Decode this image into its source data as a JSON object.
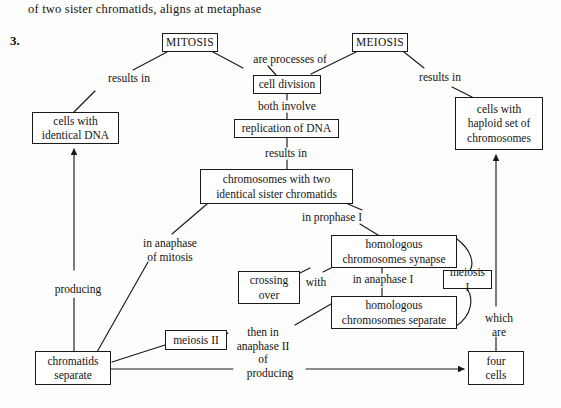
{
  "header": {
    "sentence": "of two sister chromatids, aligns at metaphase",
    "item_number": "3."
  },
  "diagram": {
    "type": "concept-map",
    "nodes": [
      {
        "id": "mitosis",
        "label": "MITOSIS",
        "x": 162,
        "y": 33,
        "w": 56,
        "h": 19
      },
      {
        "id": "meiosis",
        "label": "MEIOSIS",
        "x": 352,
        "y": 33,
        "w": 56,
        "h": 19
      },
      {
        "id": "cell-division",
        "label": "cell division",
        "x": 253,
        "y": 75,
        "w": 68,
        "h": 19
      },
      {
        "id": "replication",
        "label": "replication of DNA",
        "x": 234,
        "y": 119,
        "w": 105,
        "h": 19
      },
      {
        "id": "cells-identical",
        "label": "cells with\nidentical DNA",
        "x": 32,
        "y": 112,
        "w": 87,
        "h": 32
      },
      {
        "id": "cells-haploid",
        "label": "cells with\nhaploid set of\nchromosomes",
        "x": 455,
        "y": 97,
        "w": 88,
        "h": 53
      },
      {
        "id": "chromosomes-two",
        "label": "chromosomes with two\nidentical sister chromatids",
        "x": 200,
        "y": 169,
        "w": 153,
        "h": 35
      },
      {
        "id": "synapse",
        "label": "homologous\nchromosomes synapse",
        "x": 331,
        "y": 235,
        "w": 126,
        "h": 33
      },
      {
        "id": "crossing-over",
        "label": "crossing\nover",
        "x": 238,
        "y": 271,
        "w": 62,
        "h": 33
      },
      {
        "id": "meiosis-i",
        "label": "meiosis I",
        "x": 443,
        "y": 270,
        "w": 49,
        "h": 19
      },
      {
        "id": "separate",
        "label": "homologous\nchromosomes separate",
        "x": 331,
        "y": 296,
        "w": 126,
        "h": 33
      },
      {
        "id": "meiosis-ii",
        "label": "meiosis II",
        "x": 165,
        "y": 330,
        "w": 62,
        "h": 20
      },
      {
        "id": "chromatids-sep",
        "label": "chromatids\nseparate",
        "x": 35,
        "y": 351,
        "w": 76,
        "h": 34
      },
      {
        "id": "four-cells",
        "label": "four\ncells",
        "x": 468,
        "y": 351,
        "w": 56,
        "h": 34
      }
    ],
    "edge_labels": [
      {
        "id": "results-in-1",
        "text": "results in",
        "x": 97,
        "y": 72,
        "w": 64
      },
      {
        "id": "are-processes",
        "text": "are processes of",
        "x": 242,
        "y": 53,
        "w": 96
      },
      {
        "id": "results-in-2",
        "text": "results in",
        "x": 408,
        "y": 71,
        "w": 64
      },
      {
        "id": "both-involve",
        "text": "both involve",
        "x": 249,
        "y": 100,
        "w": 76
      },
      {
        "id": "results-in-3",
        "text": "results in",
        "x": 254,
        "y": 147,
        "w": 64
      },
      {
        "id": "in-anaphase-mit",
        "text": "in anaphase\nof mitosis",
        "x": 130,
        "y": 237,
        "w": 80
      },
      {
        "id": "in-prophase-i",
        "text": "in prophase I",
        "x": 292,
        "y": 211,
        "w": 80
      },
      {
        "id": "with",
        "text": "with",
        "x": 300,
        "y": 276,
        "w": 32
      },
      {
        "id": "in-anaphase-i",
        "text": "in anaphase I",
        "x": 340,
        "y": 273,
        "w": 86
      },
      {
        "id": "producing-left",
        "text": "producing",
        "x": 45,
        "y": 283,
        "w": 66
      },
      {
        "id": "then-in",
        "text": "then in\nanaphase II\nof",
        "x": 229,
        "y": 326,
        "w": 68
      },
      {
        "id": "which-are",
        "text": "which\nare",
        "x": 477,
        "y": 312,
        "w": 44
      },
      {
        "id": "producing-bot",
        "text": "producing",
        "x": 237,
        "y": 367,
        "w": 66
      }
    ]
  }
}
